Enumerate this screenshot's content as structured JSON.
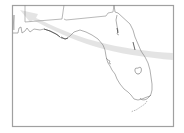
{
  "map": {
    "region": "Florida",
    "features": [
      "state-outline",
      "state-borders",
      "lake-okeechobee",
      "florida-keys",
      "track-arrow"
    ],
    "colors": {
      "background": "#ffffff",
      "frame": "#9a9a9a",
      "outline": "#7a7a7a",
      "coast_dark": "#555555",
      "arrow": "#e2e2e2"
    }
  }
}
